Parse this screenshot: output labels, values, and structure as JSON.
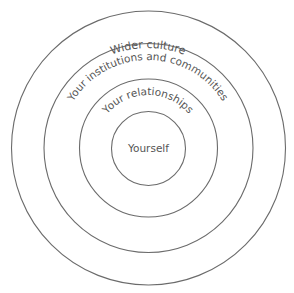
{
  "diagram": {
    "type": "concentric-circles",
    "rings": [
      {
        "id": "wider-culture",
        "label": "Wider culture",
        "radius": 137
      },
      {
        "id": "institutions",
        "label": "Your institutions and communities",
        "radius": 104
      },
      {
        "id": "relationships",
        "label": "Your relationships",
        "radius": 69
      },
      {
        "id": "yourself",
        "label": "Yourself",
        "radius": 37
      }
    ],
    "colors": {
      "stroke": "#6b6b6b",
      "text": "#555555",
      "background": "#ffffff"
    }
  }
}
